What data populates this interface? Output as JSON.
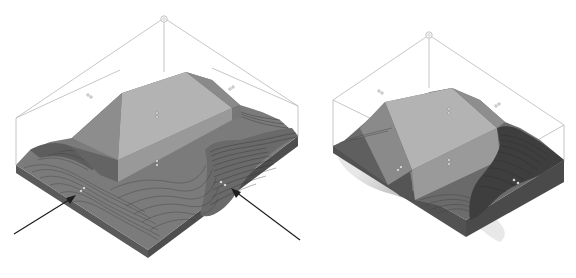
{
  "figure": {
    "colors": {
      "background": "#ffffff",
      "bounding_box": "#b8b8b8",
      "terrain_top": "#7a7a7a",
      "terrain_side_front": "#5e5e5e",
      "terrain_side_left": "#6a6a6a",
      "pad_top": "#b4b4b4",
      "pad_slope": "#8a8a8a",
      "pad_wall": "#9c9c9c",
      "shadow": "#a8a8a8",
      "arrow": "#1e1e1e"
    },
    "views": [
      {
        "name": "left-view",
        "annotations": {
          "arrows": 2,
          "markers": 6
        }
      },
      {
        "name": "right-view",
        "annotations": {
          "arrows": 0,
          "markers": 5
        }
      }
    ]
  }
}
